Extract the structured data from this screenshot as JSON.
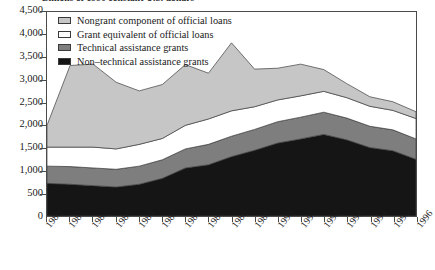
{
  "figure": {
    "supertitle": "Billions of 1996 constant U.S. dollars"
  },
  "legend": {
    "position": "top-left-inside",
    "items": [
      {
        "label": "Nongrant component of official loans",
        "color": "#c6c6c6",
        "name": "legend-nongrant-component"
      },
      {
        "label": "Grant equivalent of official loans",
        "color": "#ffffff",
        "name": "legend-grant-equivalent"
      },
      {
        "label": "Technical assistance grants",
        "color": "#7e7e7e",
        "name": "legend-technical-assistance"
      },
      {
        "label": "Non–technical assistance grants",
        "color": "#151515",
        "name": "legend-non-technical-assistance"
      }
    ]
  },
  "axes": {
    "y_ticks": [
      "0",
      "500",
      "1,000",
      "1,500",
      "2,000",
      "2,500",
      "3,000",
      "3,500",
      "4,000",
      "4,500"
    ],
    "x_ticks": [
      "1980",
      "1981",
      "1982",
      "1983",
      "1984",
      "1985",
      "1986",
      "1987",
      "1988",
      "1989",
      "1990",
      "1991",
      "1992",
      "1993",
      "1994",
      "1995",
      "1996"
    ]
  },
  "chart_data": {
    "type": "area",
    "stacked": true,
    "title": "Billions of 1996 constant U.S. dollars",
    "xlabel": "",
    "ylabel": "",
    "x": [
      1980,
      1981,
      1982,
      1983,
      1984,
      1985,
      1986,
      1987,
      1988,
      1989,
      1990,
      1991,
      1992,
      1993,
      1994,
      1995,
      1996
    ],
    "categories": [
      "1980",
      "1981",
      "1982",
      "1983",
      "1984",
      "1985",
      "1986",
      "1987",
      "1988",
      "1989",
      "1990",
      "1991",
      "1992",
      "1993",
      "1994",
      "1995",
      "1996"
    ],
    "ylim": [
      0,
      4500
    ],
    "ytick_step": 500,
    "grid": false,
    "stack_order_bottom_to_top": [
      "Non–technical assistance grants",
      "Technical assistance grants",
      "Grant equivalent of official loans",
      "Nongrant component of official loans"
    ],
    "series": [
      {
        "name": "Non–technical assistance grants",
        "color": "#151515",
        "values": [
          720,
          700,
          670,
          640,
          700,
          830,
          1060,
          1130,
          1310,
          1450,
          1610,
          1700,
          1800,
          1680,
          1510,
          1440,
          1250
        ]
      },
      {
        "name": "Technical assistance grants",
        "color": "#7e7e7e",
        "values": [
          380,
          390,
          390,
          390,
          400,
          410,
          420,
          450,
          450,
          460,
          470,
          480,
          490,
          480,
          470,
          460,
          450
        ]
      },
      {
        "name": "Grant equivalent of official loans",
        "color": "#ffffff",
        "values": [
          420,
          430,
          460,
          450,
          480,
          470,
          520,
          560,
          560,
          500,
          480,
          470,
          460,
          450,
          440,
          430,
          450
        ]
      },
      {
        "name": "Nongrant component of official loans",
        "color": "#c6c6c6",
        "values": [
          480,
          1800,
          1830,
          1470,
          1180,
          1190,
          1340,
          1010,
          1500,
          830,
          700,
          700,
          480,
          310,
          210,
          190,
          150
        ]
      }
    ],
    "totals": [
      2000,
      3320,
      3350,
      2950,
      2760,
      2900,
      3340,
      3150,
      3820,
      3240,
      3260,
      3350,
      3230,
      2920,
      2630,
      2520,
      2300
    ]
  }
}
